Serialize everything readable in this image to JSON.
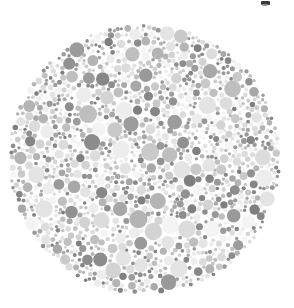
{
  "figure": {
    "type": "pseudoisochromatic-plate",
    "background_color": "#ffffff",
    "width": 294,
    "height": 308
  },
  "plate": {
    "name": "dot-mosaic-circle",
    "center_x": 144.5,
    "center_y": 159.0,
    "radius": 137.0,
    "dot_count": 940,
    "dot_radius_min": 1.6,
    "dot_radius_max": 9.2,
    "palette": [
      "#f4f4f4",
      "#ededed",
      "#e4e4e4",
      "#dcdcdc",
      "#d3d3d3",
      "#c9c9c9",
      "#bfbfbf",
      "#b4b4b4",
      "#a8a8a8",
      "#9c9c9c",
      "#919191",
      "#878787"
    ],
    "palette_weights": [
      9,
      11,
      12,
      12,
      11,
      10,
      9,
      8,
      7,
      5,
      4,
      2
    ],
    "dark_palette": [
      "#8d8d8d",
      "#868686",
      "#7f7f7f",
      "#999999"
    ],
    "dark_fraction": 0.17,
    "rng_seed": 20240517
  },
  "marks": {
    "top_right_glyph": {
      "label": "cropped-text-fragment",
      "x": 261,
      "y": 1,
      "color": "#3a3a3a"
    }
  },
  "chart_data": {
    "type": "scatter",
    "subtitle": "",
    "xlabel": "",
    "ylabel": "",
    "xlim": [
      7.5,
      281.5
    ],
    "ylim": [
      22.0,
      296.0
    ],
    "grid": false,
    "legend": null,
    "annotations": [],
    "series": [
      {
        "name": "mosaic-dots",
        "marker": "circle",
        "count": 940,
        "size_range_px": [
          1.6,
          9.2
        ],
        "color_range": [
          "#f4f4f4",
          "#878787"
        ],
        "distribution": "uniform-disc",
        "bounding_circle": {
          "cx": 144.5,
          "cy": 159.0,
          "r": 137.0
        }
      }
    ]
  }
}
